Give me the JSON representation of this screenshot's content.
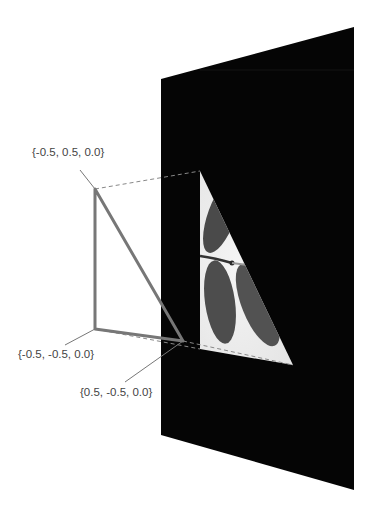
{
  "diagram": {
    "type": "texture-coordinate-mapping",
    "vertices": [
      {
        "label": "{-0.5, 0.5, 0.0}",
        "position": "top"
      },
      {
        "label": "{-0.5, -0.5, 0.0}",
        "position": "bottom-left"
      },
      {
        "label": "{0.5, -0.5, 0.0}",
        "position": "bottom-right"
      }
    ],
    "panel_color": "#050505",
    "triangle_stroke": "#777777",
    "texture_description": "grayscale leaf image mapped onto triangle"
  }
}
